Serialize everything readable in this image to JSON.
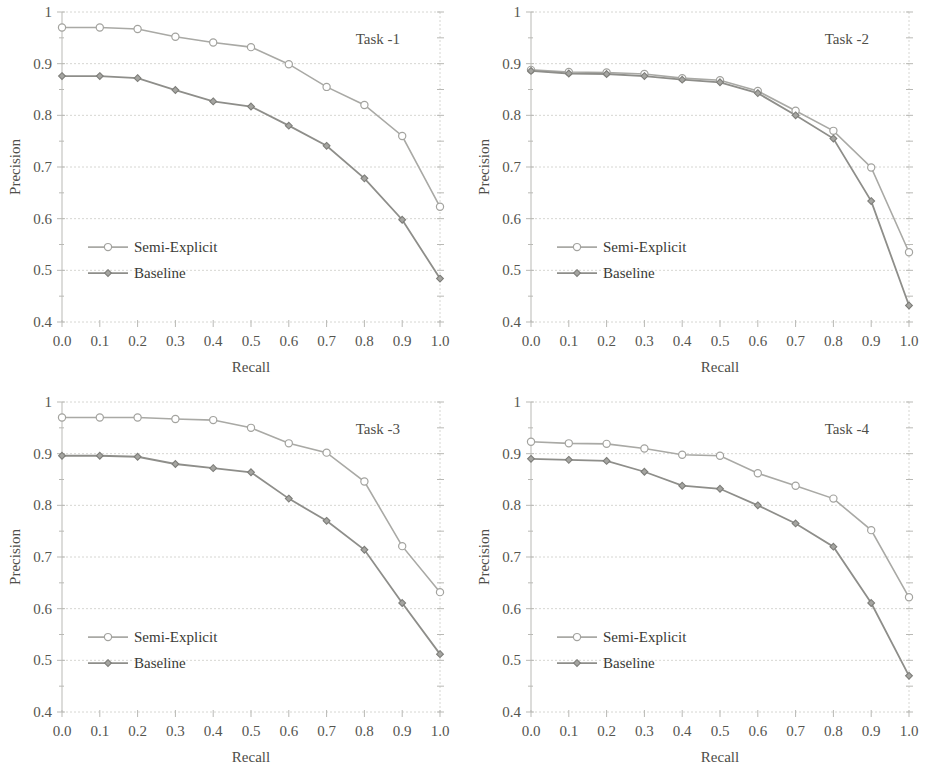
{
  "figure": {
    "panel_count": 4,
    "shared": {
      "xlabel": "Recall",
      "ylabel": "Precision",
      "x_ticks": [
        "0.0",
        "0.1",
        "0.2",
        "0.3",
        "0.4",
        "0.5",
        "0.6",
        "0.7",
        "0.8",
        "0.9",
        "1.0"
      ],
      "y_ticks": [
        "0.4",
        "0.5",
        "0.6",
        "0.7",
        "0.8",
        "0.9",
        "1"
      ],
      "legend": [
        "Semi-Explicit",
        "Baseline"
      ],
      "series_colors": [
        "#a9a9a5",
        "#8e8e8a"
      ]
    },
    "panels": [
      {
        "task_label": "Task -1"
      },
      {
        "task_label": "Task -2"
      },
      {
        "task_label": "Task -3"
      },
      {
        "task_label": "Task -4"
      }
    ]
  },
  "chart_data": [
    {
      "type": "line",
      "title": "Task -1",
      "xlabel": "Recall",
      "ylabel": "Precision",
      "xlim": [
        0.0,
        1.0
      ],
      "ylim": [
        0.4,
        1.0
      ],
      "grid": true,
      "legend_position": "inside-lower-left",
      "x": [
        0.0,
        0.1,
        0.2,
        0.3,
        0.4,
        0.5,
        0.6,
        0.7,
        0.8,
        0.9,
        1.0
      ],
      "series": [
        {
          "name": "Semi-Explicit",
          "values": [
            0.97,
            0.97,
            0.967,
            0.952,
            0.941,
            0.932,
            0.899,
            0.855,
            0.82,
            0.76,
            0.623
          ]
        },
        {
          "name": "Baseline",
          "values": [
            0.876,
            0.876,
            0.872,
            0.849,
            0.827,
            0.817,
            0.78,
            0.741,
            0.678,
            0.598,
            0.484
          ]
        }
      ]
    },
    {
      "type": "line",
      "title": "Task -2",
      "xlabel": "Recall",
      "ylabel": "Precision",
      "xlim": [
        0.0,
        1.0
      ],
      "ylim": [
        0.4,
        1.0
      ],
      "grid": true,
      "legend_position": "inside-lower-left",
      "x": [
        0.0,
        0.1,
        0.2,
        0.3,
        0.4,
        0.5,
        0.6,
        0.7,
        0.8,
        0.9,
        1.0
      ],
      "series": [
        {
          "name": "Semi-Explicit",
          "values": [
            0.888,
            0.884,
            0.883,
            0.88,
            0.872,
            0.868,
            0.847,
            0.809,
            0.77,
            0.699,
            0.535
          ]
        },
        {
          "name": "Baseline",
          "values": [
            0.886,
            0.881,
            0.88,
            0.876,
            0.869,
            0.864,
            0.843,
            0.8,
            0.755,
            0.634,
            0.432
          ]
        }
      ]
    },
    {
      "type": "line",
      "title": "Task -3",
      "xlabel": "Recall",
      "ylabel": "Precision",
      "xlim": [
        0.0,
        1.0
      ],
      "ylim": [
        0.4,
        1.0
      ],
      "grid": true,
      "legend_position": "inside-lower-left",
      "x": [
        0.0,
        0.1,
        0.2,
        0.3,
        0.4,
        0.5,
        0.6,
        0.7,
        0.8,
        0.9,
        1.0
      ],
      "series": [
        {
          "name": "Semi-Explicit",
          "values": [
            0.97,
            0.97,
            0.97,
            0.967,
            0.965,
            0.95,
            0.92,
            0.902,
            0.846,
            0.721,
            0.632
          ]
        },
        {
          "name": "Baseline",
          "values": [
            0.896,
            0.896,
            0.894,
            0.88,
            0.872,
            0.864,
            0.813,
            0.77,
            0.714,
            0.611,
            0.512
          ]
        }
      ]
    },
    {
      "type": "line",
      "title": "Task -4",
      "xlabel": "Recall",
      "ylabel": "Precision",
      "xlim": [
        0.0,
        1.0
      ],
      "ylim": [
        0.4,
        1.0
      ],
      "grid": true,
      "legend_position": "inside-lower-left",
      "x": [
        0.0,
        0.1,
        0.2,
        0.3,
        0.4,
        0.5,
        0.6,
        0.7,
        0.8,
        0.9,
        1.0
      ],
      "series": [
        {
          "name": "Semi-Explicit",
          "values": [
            0.923,
            0.92,
            0.919,
            0.91,
            0.898,
            0.896,
            0.862,
            0.838,
            0.813,
            0.752,
            0.622
          ]
        },
        {
          "name": "Baseline",
          "values": [
            0.89,
            0.888,
            0.886,
            0.865,
            0.838,
            0.832,
            0.8,
            0.765,
            0.72,
            0.611,
            0.47
          ]
        }
      ]
    }
  ]
}
